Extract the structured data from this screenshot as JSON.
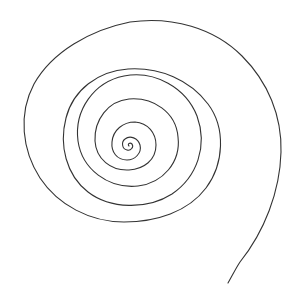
{
  "image": {
    "description": "Hand-drawn spiral line drawing on white background",
    "stroke_color": "#333333",
    "background_color": "#ffffff",
    "turns": 5
  }
}
